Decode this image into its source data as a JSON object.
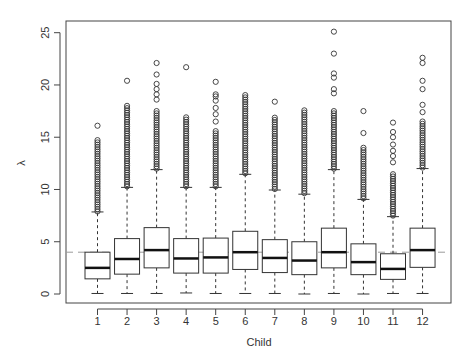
{
  "chart_data": {
    "type": "boxplot",
    "title": "",
    "xlabel": "Child",
    "ylabel": "λ",
    "ylim": [
      -1.0,
      26.0
    ],
    "yticks": [
      0,
      5,
      10,
      15,
      20,
      25
    ],
    "categories": [
      "1",
      "2",
      "3",
      "4",
      "5",
      "6",
      "7",
      "8",
      "9",
      "10",
      "11",
      "12"
    ],
    "reference_line": {
      "value": 4.0,
      "style": "dashed",
      "color": "#9a9a9a"
    },
    "grid": false,
    "legend": null,
    "boxes": [
      {
        "category": "1",
        "whisker_low": 0.05,
        "q1": 1.45,
        "median": 2.5,
        "q3": 4.0,
        "whisker_high": 7.85,
        "outlier_max": 16.1,
        "outliers_sparse": [
          16.1
        ],
        "outliers_dense_range": [
          7.9,
          14.8
        ]
      },
      {
        "category": "2",
        "whisker_low": 0.05,
        "q1": 1.9,
        "median": 3.35,
        "q3": 5.3,
        "whisker_high": 10.2,
        "outlier_max": 20.4,
        "outliers_sparse": [
          20.4
        ],
        "outliers_dense_range": [
          10.3,
          18.1
        ]
      },
      {
        "category": "3",
        "whisker_low": 0.05,
        "q1": 2.5,
        "median": 4.2,
        "q3": 6.35,
        "whisker_high": 11.9,
        "outlier_max": 22.1,
        "outliers_sparse": [
          22.1,
          21.0,
          20.1,
          19.6,
          19.1,
          18.6
        ],
        "outliers_dense_range": [
          12.0,
          17.5
        ]
      },
      {
        "category": "4",
        "whisker_low": 0.1,
        "q1": 2.0,
        "median": 3.4,
        "q3": 5.3,
        "whisker_high": 10.2,
        "outlier_max": 21.7,
        "outliers_sparse": [
          21.7
        ],
        "outliers_dense_range": [
          10.3,
          17.0
        ]
      },
      {
        "category": "5",
        "whisker_low": 0.05,
        "q1": 2.0,
        "median": 3.5,
        "q3": 5.35,
        "whisker_high": 10.2,
        "outlier_max": 20.3,
        "outliers_sparse": [
          20.3,
          19.1,
          18.9,
          18.5,
          17.8,
          17.2,
          16.5
        ],
        "outliers_dense_range": [
          10.3,
          15.7
        ]
      },
      {
        "category": "6",
        "whisker_low": 0.05,
        "q1": 2.35,
        "median": 4.0,
        "q3": 6.0,
        "whisker_high": 11.45,
        "outlier_max": 19.1,
        "outliers_sparse": [],
        "outliers_dense_range": [
          11.55,
          19.1
        ]
      },
      {
        "category": "7",
        "whisker_low": 0.05,
        "q1": 2.05,
        "median": 3.45,
        "q3": 5.2,
        "whisker_high": 9.95,
        "outlier_max": 18.4,
        "outliers_sparse": [
          18.4
        ],
        "outliers_dense_range": [
          10.05,
          16.9
        ]
      },
      {
        "category": "8",
        "whisker_low": 0.0,
        "q1": 1.85,
        "median": 3.2,
        "q3": 5.0,
        "whisker_high": 9.55,
        "outlier_max": 17.7,
        "outliers_sparse": [],
        "outliers_dense_range": [
          9.65,
          17.7
        ]
      },
      {
        "category": "9",
        "whisker_low": 0.05,
        "q1": 2.5,
        "median": 4.0,
        "q3": 6.3,
        "whisker_high": 11.9,
        "outlier_max": 25.1,
        "outliers_sparse": [
          25.1,
          23.0,
          21.1,
          20.7,
          19.6,
          19.2
        ],
        "outliers_dense_range": [
          12.0,
          17.5
        ]
      },
      {
        "category": "10",
        "whisker_low": 0.0,
        "q1": 1.85,
        "median": 3.05,
        "q3": 4.8,
        "whisker_high": 9.05,
        "outlier_max": 17.5,
        "outliers_sparse": [
          17.5,
          15.4
        ],
        "outliers_dense_range": [
          9.15,
          14.2
        ]
      },
      {
        "category": "11",
        "whisker_low": 0.05,
        "q1": 1.4,
        "median": 2.4,
        "q3": 3.85,
        "whisker_high": 7.4,
        "outlier_max": 16.4,
        "outliers_sparse": [
          16.4,
          15.5,
          15.0,
          14.3,
          13.7,
          13.2,
          12.6
        ],
        "outliers_dense_range": [
          7.5,
          11.6
        ]
      },
      {
        "category": "12",
        "whisker_low": 0.05,
        "q1": 2.55,
        "median": 4.2,
        "q3": 6.3,
        "whisker_high": 12.0,
        "outlier_max": 22.6,
        "outliers_sparse": [
          22.6,
          22.1,
          20.4,
          19.6,
          18.1,
          17.4
        ],
        "outliers_dense_range": [
          12.1,
          16.6
        ]
      }
    ]
  }
}
